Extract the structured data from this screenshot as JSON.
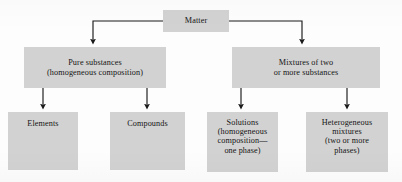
{
  "figure": {
    "kind": "classification-flowchart",
    "box_fill_color": "#d2d2d2",
    "line_color": "#1a1a1a",
    "background_color": "#fdfdfd"
  },
  "nodes": {
    "matter": {
      "id": "matter",
      "label": "Matter",
      "level": 0
    },
    "pure_substances": {
      "id": "pure-substances",
      "label": "Pure substances\n(homogeneous composition)",
      "level": 1
    },
    "mixtures": {
      "id": "mixtures",
      "label": "Mixtures of two\nor more substances",
      "level": 1
    },
    "elements": {
      "id": "elements",
      "label": "Elements",
      "level": 2
    },
    "compounds": {
      "id": "compounds",
      "label": "Compounds",
      "level": 2
    },
    "solutions": {
      "id": "solutions",
      "label": "Solutions\n(homogeneous\ncomposition—\none phase)",
      "level": 2
    },
    "heterogeneous_mixtures": {
      "id": "heterogeneous-mixtures",
      "label": "Heterogeneous\nmixtures\n(two or more\nphases)",
      "level": 2
    }
  },
  "edges": [
    {
      "from": "matter",
      "to": "pure_substances",
      "style": "elbow-left-down-arrow"
    },
    {
      "from": "matter",
      "to": "mixtures",
      "style": "elbow-right-down-arrow"
    },
    {
      "from": "pure_substances",
      "to": "elements",
      "style": "straight-down-arrow"
    },
    {
      "from": "pure_substances",
      "to": "compounds",
      "style": "straight-down-arrow"
    },
    {
      "from": "mixtures",
      "to": "solutions",
      "style": "straight-down-arrow"
    },
    {
      "from": "mixtures",
      "to": "heterogeneous_mixtures",
      "style": "straight-down-arrow"
    }
  ]
}
